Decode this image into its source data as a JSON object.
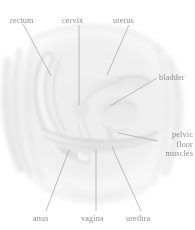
{
  "figure": {
    "background_color": "#ffffff",
    "label_color": "#8e8e8e",
    "leader_line_color": "#a8a8a8",
    "tissue_tint": "#ececec",
    "organ_tint": "#e2e2e2"
  },
  "labels": {
    "rectum": "rectum",
    "cervix": "cervix",
    "uterus": "uterus",
    "bladder": "bladder",
    "pelvic_floor_muscles": "pelvic\nfloor\nmuscles",
    "pelvic_floor_line1": "pelvic",
    "pelvic_floor_line2": "floor",
    "pelvic_floor_line3": "muscles",
    "anus": "anus",
    "vagina": "vagina",
    "urethra": "urethra"
  },
  "leader_lines": [
    {
      "name": "rectum",
      "x1": 23,
      "y1": 24,
      "x2": 51,
      "y2": 76
    },
    {
      "name": "cervix",
      "x1": 79,
      "y1": 25,
      "x2": 79,
      "y2": 105
    },
    {
      "name": "uterus",
      "x1": 129,
      "y1": 25,
      "x2": 107,
      "y2": 75
    },
    {
      "name": "bladder",
      "x1": 157,
      "y1": 78,
      "x2": 110,
      "y2": 106
    },
    {
      "name": "pelvic-floor",
      "x1": 158,
      "y1": 141,
      "x2": 118,
      "y2": 133
    },
    {
      "name": "anus",
      "x1": 46,
      "y1": 211,
      "x2": 69,
      "y2": 150
    },
    {
      "name": "vagina",
      "x1": 96,
      "y1": 211,
      "x2": 96,
      "y2": 150
    },
    {
      "name": "urethra",
      "x1": 141,
      "y1": 211,
      "x2": 112,
      "y2": 147
    }
  ],
  "structures": [
    {
      "name": "rectum",
      "description": "long curved tube on the left"
    },
    {
      "name": "uterus",
      "description": "forward-tilted body upper centre-right"
    },
    {
      "name": "cervix",
      "description": "narrow neck at centre"
    },
    {
      "name": "bladder",
      "description": "rounded sac right of centre"
    },
    {
      "name": "vagina",
      "description": "central canal running down"
    },
    {
      "name": "urethra",
      "description": "short canal right of vagina"
    },
    {
      "name": "anus",
      "description": "lower-left opening"
    },
    {
      "name": "pelvic-floor-muscles",
      "description": "horizontal band across lower pelvis"
    }
  ]
}
